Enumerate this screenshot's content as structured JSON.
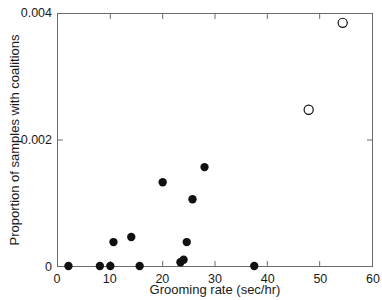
{
  "chart_data": {
    "type": "scatter",
    "title": "",
    "xlabel": "Grooming rate (sec/hr)",
    "ylabel": "Proportion of samples with coalitions",
    "xlim": [
      0,
      60
    ],
    "ylim": [
      0,
      0.004
    ],
    "xticks": [
      0,
      10,
      20,
      30,
      40,
      50,
      60
    ],
    "xtick_labels": [
      "0",
      "10",
      "20",
      "30",
      "40",
      "50",
      "60"
    ],
    "yticks": [
      0,
      0.002,
      0.004
    ],
    "ytick_labels": [
      "0",
      "0.002",
      "0.004"
    ],
    "grid": false,
    "legend": "none",
    "series": [
      {
        "name": "filled",
        "marker": "filled-circle",
        "color": "#101010",
        "points": [
          {
            "x": 2.0,
            "y": 0.0
          },
          {
            "x": 8.0,
            "y": 0.0
          },
          {
            "x": 10.0,
            "y": 0.0
          },
          {
            "x": 10.6,
            "y": 0.00038
          },
          {
            "x": 14.0,
            "y": 0.00046
          },
          {
            "x": 15.6,
            "y": 0.0
          },
          {
            "x": 20.0,
            "y": 0.00133
          },
          {
            "x": 23.4,
            "y": 6e-05
          },
          {
            "x": 24.0,
            "y": 0.0001
          },
          {
            "x": 24.6,
            "y": 0.00038
          },
          {
            "x": 25.7,
            "y": 0.00106
          },
          {
            "x": 28.0,
            "y": 0.00157
          },
          {
            "x": 37.5,
            "y": 0.0
          }
        ]
      },
      {
        "name": "open",
        "marker": "open-circle",
        "color": "#101010",
        "points": [
          {
            "x": 47.9,
            "y": 0.00248
          },
          {
            "x": 54.4,
            "y": 0.00386
          }
        ]
      }
    ]
  }
}
